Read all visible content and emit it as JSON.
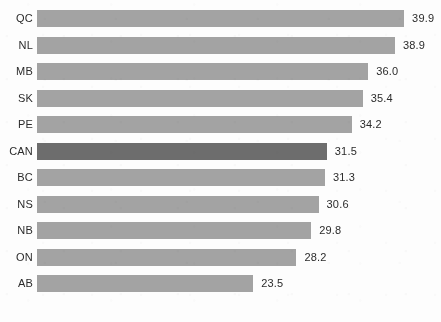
{
  "chart_data": {
    "type": "bar",
    "orientation": "horizontal",
    "title": "",
    "subtitle": "",
    "xlabel": "",
    "ylabel": "",
    "categories": [
      "QC",
      "NL",
      "MB",
      "SK",
      "PE",
      "CAN",
      "BC",
      "NS",
      "NB",
      "ON",
      "AB"
    ],
    "values": [
      39.9,
      38.9,
      36.0,
      35.4,
      34.2,
      31.5,
      31.3,
      30.6,
      29.8,
      28.2,
      23.5
    ],
    "value_labels": [
      "39.9",
      "38.9",
      "36.0",
      "35.4",
      "34.2",
      "31.5",
      "31.3",
      "30.6",
      "29.8",
      "28.2",
      "23.5"
    ],
    "highlight_category": "CAN",
    "xlim": [
      0,
      39.9
    ],
    "grid": false,
    "legend": false,
    "axis_visible": false,
    "tick_labels": [],
    "annotations": [],
    "colors": {
      "bar": "#a3a3a3",
      "bar_highlight": "#6d6d6d",
      "text": "#2b2b2b",
      "background": "#fdfdfd"
    }
  },
  "layout": {
    "bar_left_px": 37,
    "bar_height_px": 17,
    "row_pitch_px": 26.5,
    "first_row_top_px": 10,
    "px_per_unit": 9.2,
    "value_gap_px": 8
  }
}
